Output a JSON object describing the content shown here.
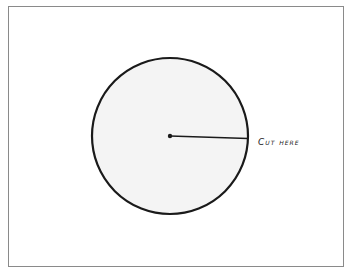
{
  "diagram": {
    "label": "Cut here",
    "circle": {
      "cx": 170,
      "cy": 136,
      "r": 78,
      "fill": "#f4f4f4",
      "stroke": "#1a1a1a"
    },
    "radius_line": {
      "x1": 170,
      "y1": 136,
      "x2": 248,
      "y2": 138
    }
  }
}
